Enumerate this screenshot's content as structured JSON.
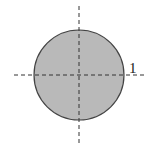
{
  "diagram": {
    "shape": "circle",
    "fill_color": "#b9b9b9",
    "stroke_color": "#444444",
    "axis_color": "#333333",
    "radius_label": "1",
    "center": [
      79,
      75
    ],
    "radius": 45
  }
}
